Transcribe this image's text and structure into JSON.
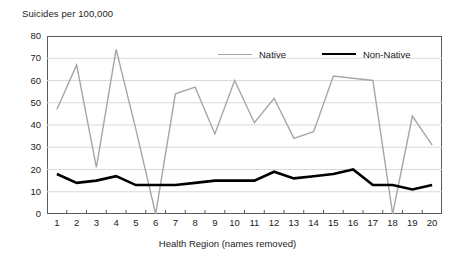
{
  "chart_data": {
    "type": "line",
    "title": "Suicides per 100,000",
    "xlabel": "Health Region (names removed)",
    "ylabel": "",
    "ylim": [
      0,
      80
    ],
    "ytick_step": 10,
    "yticks": [
      80,
      70,
      60,
      50,
      40,
      30,
      20,
      10,
      0
    ],
    "grid": true,
    "grid_axis": "y",
    "legend_position": "top-center-inside",
    "categories": [
      1,
      2,
      3,
      4,
      5,
      6,
      7,
      8,
      9,
      10,
      11,
      12,
      13,
      14,
      15,
      16,
      17,
      18,
      19,
      20
    ],
    "x": [
      1,
      2,
      3,
      4,
      5,
      6,
      7,
      8,
      9,
      10,
      11,
      12,
      13,
      14,
      15,
      16,
      17,
      18,
      19,
      20
    ],
    "series": [
      {
        "name": "Native",
        "color": "#a6a6a6",
        "width": 1.4,
        "values": [
          47,
          67,
          21,
          74,
          38,
          0,
          54,
          57,
          36,
          60,
          41,
          52,
          34,
          37,
          62,
          61,
          60,
          0,
          44,
          31
        ]
      },
      {
        "name": "Non-Native",
        "color": "#000000",
        "width": 2.6,
        "values": [
          18,
          14,
          15,
          17,
          13,
          13,
          13,
          14,
          15,
          15,
          15,
          19,
          16,
          17,
          18,
          20,
          13,
          13,
          11,
          13
        ]
      }
    ]
  },
  "chart": {
    "title": "Suicides per 100,000",
    "xaxis_title": "Health Region (names removed)",
    "ytick_labels": [
      "80",
      "70",
      "60",
      "50",
      "40",
      "30",
      "20",
      "10",
      "0"
    ],
    "xtick_labels": [
      "1",
      "2",
      "3",
      "4",
      "5",
      "6",
      "7",
      "8",
      "9",
      "10",
      "11",
      "12",
      "13",
      "14",
      "15",
      "16",
      "17",
      "18",
      "19",
      "20"
    ],
    "legend": [
      {
        "label": "Native",
        "color": "#a6a6a6"
      },
      {
        "label": "Non-Native",
        "color": "#000000"
      }
    ],
    "colors": {
      "native": "#a6a6a6",
      "non_native": "#000000",
      "frame": "#5a5a5a",
      "gridline": "#d9d9d9",
      "background": "#ffffff",
      "text": "#222222"
    }
  }
}
